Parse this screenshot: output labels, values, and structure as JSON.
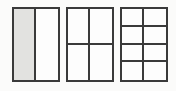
{
  "figure": {
    "background_color": "#fbfbfa",
    "line_color": "#3a3a3a",
    "cell_fill_color": "#fdfdfd",
    "shaded_fill_color": "#e2e2e0",
    "rectangles": [
      {
        "name": "rect-halves",
        "columns": 2,
        "rows": 1,
        "total_parts": 2,
        "shaded_parts": 1,
        "fraction_shaded": "1/2",
        "cells": [
          {
            "shaded": true
          },
          {
            "shaded": false
          }
        ]
      },
      {
        "name": "rect-fourths",
        "columns": 2,
        "rows": 2,
        "total_parts": 4,
        "shaded_parts": 0,
        "fraction_shaded": "0/4",
        "cells": [
          {
            "shaded": false
          },
          {
            "shaded": false
          },
          {
            "shaded": false
          },
          {
            "shaded": false
          }
        ]
      },
      {
        "name": "rect-eighths",
        "columns": 2,
        "rows": 4,
        "total_parts": 8,
        "shaded_parts": 0,
        "fraction_shaded": "0/8",
        "cells": [
          {
            "shaded": false
          },
          {
            "shaded": false
          },
          {
            "shaded": false
          },
          {
            "shaded": false
          },
          {
            "shaded": false
          },
          {
            "shaded": false
          },
          {
            "shaded": false
          },
          {
            "shaded": false
          }
        ]
      }
    ]
  }
}
